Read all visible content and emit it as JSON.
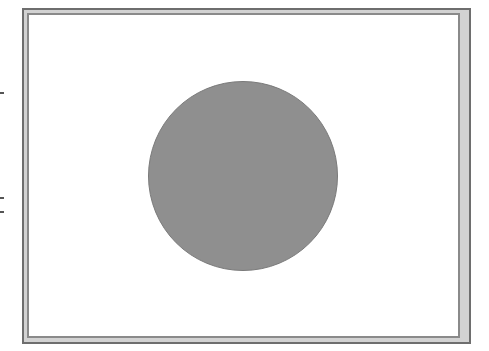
{
  "figure": {
    "frame": {
      "outer_color": "#6e6e6e",
      "band_color": "#d2d2d2",
      "inner_line_color": "#8a8a8a",
      "background": "#ffffff"
    },
    "circle": {
      "fill_color": "#8f8f8f",
      "edge_color": "#7a7a7a",
      "center_x": 243,
      "center_y": 176,
      "diameter": 190
    }
  }
}
